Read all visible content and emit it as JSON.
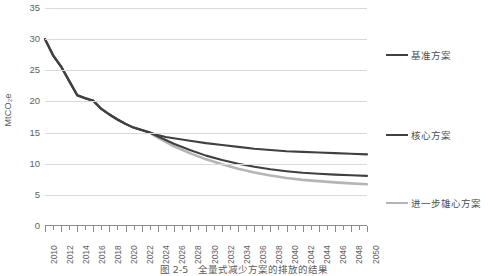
{
  "chart_data": {
    "type": "line",
    "title": "",
    "xlabel": "",
    "ylabel": "MtCO₂e",
    "ylim": [
      0,
      35
    ],
    "xlim": [
      2010,
      2050
    ],
    "yticks": [
      0,
      5,
      10,
      15,
      20,
      25,
      30,
      35
    ],
    "xticks": [
      2010,
      2012,
      2014,
      2016,
      2018,
      2020,
      2022,
      2024,
      2026,
      2028,
      2030,
      2032,
      2034,
      2036,
      2038,
      2040,
      2042,
      2044,
      2046,
      2048,
      2050
    ],
    "grid": true,
    "legend_position": "right",
    "x": [
      2010,
      2011,
      2012,
      2013,
      2014,
      2015,
      2016,
      2017,
      2018,
      2019,
      2020,
      2021,
      2022,
      2023,
      2024,
      2025,
      2026,
      2028,
      2030,
      2032,
      2034,
      2036,
      2038,
      2040,
      2042,
      2044,
      2046,
      2048,
      2050
    ],
    "series": [
      {
        "name": "基准方案",
        "color": "#404040",
        "values": [
          30.0,
          27.4,
          25.6,
          23.3,
          21.0,
          20.5,
          20.1,
          18.8,
          17.9,
          17.1,
          16.4,
          15.8,
          15.4,
          15.0,
          14.6,
          14.3,
          14.1,
          13.7,
          13.3,
          13.0,
          12.7,
          12.4,
          12.2,
          12.0,
          11.9,
          11.8,
          11.7,
          11.6,
          11.5
        ]
      },
      {
        "name": "核心方案",
        "color": "#404040",
        "values": [
          30.0,
          27.4,
          25.6,
          23.3,
          21.0,
          20.5,
          20.1,
          18.8,
          17.9,
          17.1,
          16.4,
          15.8,
          15.4,
          15.0,
          14.4,
          13.8,
          13.2,
          12.2,
          11.3,
          10.6,
          10.0,
          9.5,
          9.1,
          8.8,
          8.55,
          8.4,
          8.25,
          8.15,
          8.05
        ]
      },
      {
        "name": "进一步雄心方案",
        "color": "#b5b5b5",
        "values": [
          30.0,
          27.4,
          25.6,
          23.3,
          21.0,
          20.5,
          20.1,
          18.8,
          17.9,
          17.1,
          16.4,
          15.8,
          15.4,
          15.0,
          14.2,
          13.5,
          12.8,
          11.7,
          10.7,
          9.9,
          9.2,
          8.6,
          8.1,
          7.7,
          7.4,
          7.2,
          7.0,
          6.85,
          6.7
        ]
      }
    ]
  },
  "axis": {
    "y_label": "MtCO₂e",
    "y_ticks": [
      "0",
      "5",
      "10",
      "15",
      "20",
      "25",
      "30",
      "35"
    ],
    "x_ticks": [
      "2010",
      "2012",
      "2014",
      "2016",
      "2018",
      "2020",
      "2022",
      "2024",
      "2026",
      "2028",
      "2030",
      "2032",
      "2034",
      "2036",
      "2038",
      "2040",
      "2042",
      "2044",
      "2046",
      "2048",
      "2050"
    ]
  },
  "legend": {
    "items": [
      {
        "label": "基准方案",
        "color": "#404040"
      },
      {
        "label": "核心方案",
        "color": "#404040"
      },
      {
        "label": "进一步雄心方案",
        "color": "#b5b5b5"
      }
    ]
  },
  "caption": {
    "text": "图 2-5　全量式减少方案的排放的结果"
  },
  "colors": {
    "gridline": "#d9d9d9",
    "axis": "#8c8c8c",
    "dark_series": "#404040",
    "light_series": "#b5b5b5",
    "text": "#5f5f5f",
    "background": "#ffffff"
  }
}
